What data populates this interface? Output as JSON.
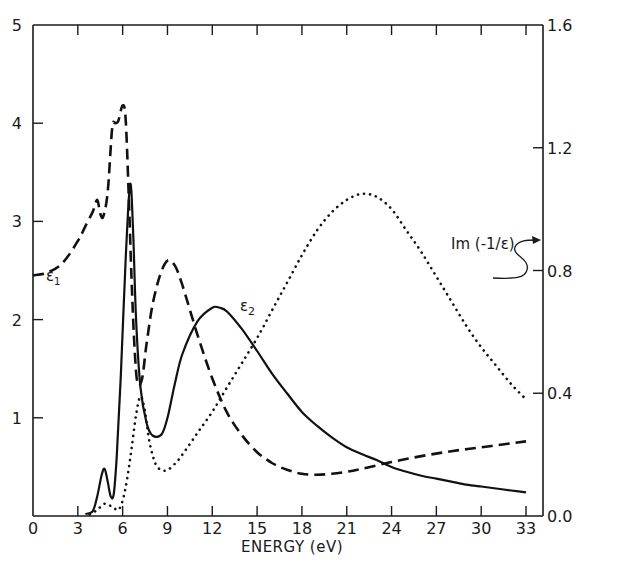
{
  "chart_data": {
    "type": "line",
    "title": "",
    "xlabel": "ENERGY (eV)",
    "ylabel_left": "",
    "ylabel_right": "",
    "xlim": [
      0,
      34.2
    ],
    "ylim_left": [
      0,
      5
    ],
    "ylim_right": [
      0.0,
      1.6
    ],
    "grid": false,
    "legend": "inline labels",
    "x_ticks": [
      "0",
      "3",
      "6",
      "9",
      "12",
      "15",
      "18",
      "21",
      "24",
      "27",
      "30",
      "33"
    ],
    "y_ticks_left": [
      "0",
      "1",
      "2",
      "3",
      "4",
      "5"
    ],
    "y_ticks_right": [
      "0.0",
      "0.4",
      "0.8",
      "1.2",
      "1.6"
    ],
    "annotations": [
      {
        "text": "ε1",
        "x": 1.2,
        "y": 2.8
      },
      {
        "text": "ε2",
        "x": 13.8,
        "y": 2.15
      },
      {
        "text": "Im (-1/ε)",
        "x": 25.5,
        "y": 0.88,
        "axis": "right",
        "arrow_to": "right axis"
      }
    ],
    "series": [
      {
        "name": "ε1",
        "style": "dashed",
        "axis": "left",
        "x": [
          0,
          1,
          2,
          3,
          3.5,
          4,
          4.3,
          4.5,
          4.7,
          5.0,
          5.3,
          5.5,
          5.7,
          6.0,
          6.2,
          6.4,
          6.6,
          6.8,
          7.0,
          7.3,
          7.6,
          8.0,
          8.5,
          9.0,
          9.5,
          10,
          11,
          12,
          13,
          14,
          15,
          16,
          17,
          18,
          19,
          20,
          21,
          22,
          24,
          26,
          28,
          30,
          32,
          33
        ],
        "y": [
          2.45,
          2.48,
          2.58,
          2.8,
          2.95,
          3.1,
          3.22,
          3.08,
          3.05,
          3.3,
          3.95,
          4.0,
          4.02,
          4.18,
          4.05,
          3.3,
          2.4,
          1.7,
          1.35,
          1.4,
          1.75,
          2.15,
          2.45,
          2.6,
          2.55,
          2.35,
          1.85,
          1.4,
          1.05,
          0.82,
          0.65,
          0.54,
          0.47,
          0.43,
          0.42,
          0.43,
          0.45,
          0.48,
          0.55,
          0.61,
          0.66,
          0.7,
          0.74,
          0.76
        ]
      },
      {
        "name": "ε2",
        "style": "solid",
        "axis": "left",
        "x": [
          3.5,
          4.0,
          4.3,
          4.6,
          4.8,
          5.0,
          5.2,
          5.4,
          5.6,
          5.9,
          6.2,
          6.5,
          6.7,
          6.9,
          7.2,
          7.6,
          8.0,
          8.6,
          9.0,
          9.5,
          10,
          11,
          12,
          12.5,
          13,
          14,
          15,
          16,
          17,
          18,
          19,
          20,
          21,
          22,
          23,
          24,
          25,
          26,
          27,
          28,
          29,
          30,
          31,
          32,
          33
        ],
        "y": [
          0.02,
          0.05,
          0.2,
          0.42,
          0.48,
          0.35,
          0.2,
          0.22,
          0.6,
          1.5,
          2.6,
          3.38,
          2.9,
          2.0,
          1.3,
          0.95,
          0.82,
          0.83,
          1.0,
          1.35,
          1.65,
          1.98,
          2.12,
          2.12,
          2.08,
          1.9,
          1.68,
          1.45,
          1.25,
          1.06,
          0.92,
          0.8,
          0.7,
          0.63,
          0.57,
          0.5,
          0.45,
          0.41,
          0.38,
          0.35,
          0.32,
          0.3,
          0.28,
          0.26,
          0.24
        ]
      },
      {
        "name": "Im(-1/ε)",
        "style": "dotted",
        "axis": "right",
        "x": [
          3.8,
          4.3,
          4.8,
          5.3,
          5.7,
          6.0,
          6.3,
          6.6,
          6.9,
          7.2,
          7.5,
          7.8,
          8.2,
          8.6,
          9.0,
          9.5,
          10,
          11,
          12,
          13,
          14,
          15,
          16,
          17,
          18,
          19,
          20,
          21,
          22,
          23,
          24,
          25,
          26,
          27,
          28,
          29,
          30,
          31,
          32,
          33
        ],
        "y": [
          0.005,
          0.02,
          0.04,
          0.03,
          0.02,
          0.05,
          0.12,
          0.22,
          0.33,
          0.39,
          0.34,
          0.24,
          0.17,
          0.15,
          0.15,
          0.17,
          0.2,
          0.27,
          0.34,
          0.42,
          0.5,
          0.58,
          0.67,
          0.76,
          0.85,
          0.93,
          0.99,
          1.03,
          1.05,
          1.04,
          1.0,
          0.93,
          0.86,
          0.78,
          0.7,
          0.62,
          0.55,
          0.49,
          0.43,
          0.38
        ]
      }
    ]
  }
}
